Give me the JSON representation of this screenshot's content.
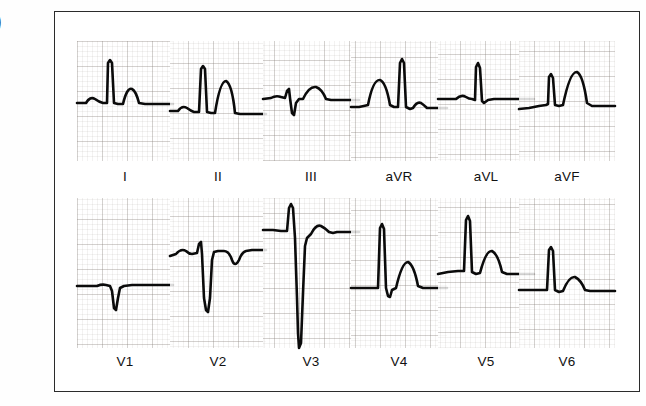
{
  "figure": {
    "edge_glyph": ")",
    "border_color": "#2b2b2b",
    "trace_color": "#0b0b0b",
    "grid_color": "#786e69",
    "background": "#ffffff"
  },
  "chart_data": {
    "type": "line",
    "title": "",
    "subtitle": "",
    "xlabel": "",
    "ylabel": "",
    "grid": true,
    "legend_position": "none",
    "rows": [
      {
        "row_index": 0,
        "leads": [
          "I",
          "II",
          "III",
          "aVR",
          "aVL",
          "aVF"
        ]
      },
      {
        "row_index": 1,
        "leads": [
          "V1",
          "V2",
          "V3",
          "V4",
          "V5",
          "V6"
        ]
      }
    ],
    "series": [
      {
        "name": "I",
        "label": "I",
        "row": 0,
        "col": 0,
        "baseline_frac": 0.7,
        "features": {
          "p": "small upright",
          "qrs": "tall narrow R",
          "t": "moderate upright"
        },
        "path": "M0,62 L9,62 Q13,55 18,58 Q22,61 26,62 L30,62 L31,22 L33,19 L35,22 L37,62 L41,63 L46,63 Q50,46 55,48 Q59,50 62,62 L68,63 L96,63"
      },
      {
        "name": "II",
        "label": "II",
        "row": 0,
        "col": 1,
        "baseline_frac": 0.78,
        "features": {
          "p": "small upright",
          "qrs": "tall narrow R",
          "t": "tall broad upright"
        },
        "path": "M0,70 L8,70 Q12,64 17,67 Q21,70 24,71 L29,71 L31,28 L33,25 L35,28 L37,71 L41,72 L45,72 Q50,40 56,40 Q62,43 65,72 L70,73 L96,73"
      },
      {
        "name": "III",
        "label": "III",
        "row": 0,
        "col": 2,
        "baseline_frac": 0.62,
        "features": {
          "p": "flat",
          "qrs": "small rS with negative deflection",
          "t": "low rounded upright"
        },
        "path": "M0,58 L8,57 Q13,54 18,56 L22,57 L24,50 L26,48 L27,57 L29,72 L31,74 L33,62 L36,58 L40,58 Q46,45 53,46 Q59,48 63,58 L68,59 L96,59"
      },
      {
        "name": "aVR",
        "label": "aVR",
        "row": 0,
        "col": 3,
        "baseline_frac": 0.72,
        "features": {
          "p": "broad rounded hump",
          "qrs": "tall narrow spike",
          "t": "small"
        },
        "path": "M0,66 L8,66 Q13,65 17,64 Q22,38 29,39 Q35,41 39,64 L43,66 L47,66 L49,22 L51,18 L53,22 L55,66 L59,68 L62,67 Q66,60 70,62 Q73,64 76,67 L80,67 L96,67"
      },
      {
        "name": "aVL",
        "label": "aVL",
        "row": 0,
        "col": 4,
        "baseline_frac": 0.62,
        "features": {
          "p": "small upright",
          "qrs": "narrow tall R spike",
          "t": "flat"
        },
        "path": "M0,58 L10,58 L18,58 Q23,53 28,56 Q31,58 34,58 L37,59 L38,26 L40,22 L42,27 L44,60 L46,62 L50,59 L56,58 L70,58 L96,58"
      },
      {
        "name": "aVF",
        "label": "aVF",
        "row": 0,
        "col": 5,
        "baseline_frac": 0.68,
        "features": {
          "p": "flat upsloping",
          "qrs": "narrow R spike",
          "t": "tall broad upright"
        },
        "path": "M0,68 L10,67 L20,65 L27,64 L29,63 L30,36 L32,33 L34,37 L36,64 L40,65 L44,64 Q51,30 58,31 Q64,34 68,62 L73,65 L78,65 L96,65"
      },
      {
        "name": "V1",
        "label": "V1",
        "row": 1,
        "col": 0,
        "baseline_frac": 0.76,
        "features": {
          "p": "flat",
          "qrs": "small QS negative",
          "t": "flat"
        },
        "path": "M0,88 L12,88 L20,88 Q25,86 29,87 L33,88 L35,93 L37,110 L39,112 L41,100 L43,90 L47,88 L55,87 L70,87 L96,87"
      },
      {
        "name": "V2",
        "label": "V2",
        "row": 1,
        "col": 1,
        "baseline_frac": 0.54,
        "features": {
          "p": "small upright",
          "qrs": "rS with deep narrow S",
          "t": "inverted"
        },
        "path": "M0,58 L6,56 Q11,50 16,53 Q19,56 22,56 L27,55 L29,46 L31,44 L32,56 L34,100 L36,112 L38,114 L40,100 L42,62 L44,54 L48,53 L54,53 Q59,53 62,62 Q65,70 69,62 Q72,54 76,53 L82,52 L96,52"
      },
      {
        "name": "V3",
        "label": "V3",
        "row": 1,
        "col": 2,
        "baseline_frac": 0.3,
        "features": {
          "p": "flat",
          "qrs": "RS with very deep S",
          "t": "rounded upright"
        },
        "path": "M0,32 L10,32 L18,33 L24,33 L26,10 L28,6 L30,10 L32,40 L34,100 L35,135 L36,150 L38,145 L40,95 L42,48 L44,40 L48,36 Q53,26 58,28 Q62,30 66,34 L70,35 L74,34 L80,34 L96,34"
      },
      {
        "name": "V4",
        "label": "V4",
        "row": 1,
        "col": 3,
        "baseline_frac": 0.74,
        "features": {
          "p": "flat",
          "qrs": "tall narrow R with small S",
          "t": "moderate rounded upright"
        },
        "path": "M0,90 L12,90 L22,90 L27,90 L29,30 L31,26 L33,31 L35,90 L37,98 L39,99 L41,92 L45,90 Q51,64 57,64 Q63,67 67,88 L72,90 L78,90 L96,90"
      },
      {
        "name": "V5",
        "label": "V5",
        "row": 1,
        "col": 4,
        "baseline_frac": 0.62,
        "features": {
          "p": "flat",
          "qrs": "tall narrow R",
          "t": "moderate rounded upright"
        },
        "path": "M0,76 L10,74 L20,73 L26,73 L28,22 L30,18 L32,23 L34,74 L38,76 L42,75 Q48,52 54,53 Q60,56 64,74 L69,76 L76,76 L96,76"
      },
      {
        "name": "V6",
        "label": "V6",
        "row": 1,
        "col": 5,
        "baseline_frac": 0.76,
        "features": {
          "p": "flat",
          "qrs": "moderate narrow R",
          "t": "low rounded upright"
        },
        "path": "M0,92 L12,92 L22,92 L28,92 L30,52 L32,49 L34,53 L36,92 L40,94 L44,93 Q50,78 56,79 Q62,82 66,92 L71,93 L78,93 L96,93"
      }
    ]
  }
}
